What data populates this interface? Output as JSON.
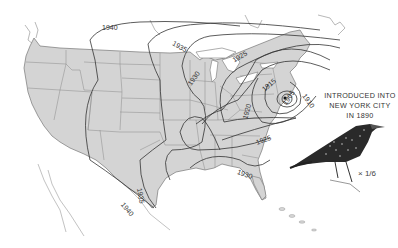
{
  "map": {
    "title": "Spread of the European Starling in North America",
    "caption_lines": [
      "INTRODUCED  INTO",
      "NEW YORK CITY",
      "IN 1890"
    ],
    "scale_label": "× 1/6",
    "colors": {
      "land": "#d4d4d4",
      "border": "#7a7a7a",
      "contour": "#3a3a3a",
      "background": "#ffffff"
    },
    "isochrone_labels": [
      {
        "year": "1905",
        "x": 287,
        "y": 104,
        "rotate": -55
      },
      {
        "year": "1910",
        "x": 306,
        "y": 98,
        "rotate": 55
      },
      {
        "year": "1915",
        "x": 267,
        "y": 87,
        "rotate": -40
      },
      {
        "year": "1920",
        "x": 246,
        "y": 113,
        "rotate": -75
      },
      {
        "year": "1920",
        "x": 183,
        "y": 133,
        "rotate": -75
      },
      {
        "year": "1925",
        "x": 238,
        "y": 57,
        "rotate": -30
      },
      {
        "year": "1925",
        "x": 262,
        "y": 141,
        "rotate": -20
      },
      {
        "year": "1930",
        "x": 193,
        "y": 80,
        "rotate": -55
      },
      {
        "year": "1930",
        "x": 243,
        "y": 174,
        "rotate": 20
      },
      {
        "year": "1930",
        "x": 252,
        "y": 75,
        "rotate": -40
      },
      {
        "year": "1935",
        "x": 178,
        "y": 46,
        "rotate": 30
      },
      {
        "year": "1935",
        "x": 140,
        "y": 194,
        "rotate": 80
      },
      {
        "year": "1940",
        "x": 108,
        "y": 28,
        "rotate": 0
      },
      {
        "year": "1940",
        "x": 126,
        "y": 208,
        "rotate": 50
      }
    ]
  }
}
